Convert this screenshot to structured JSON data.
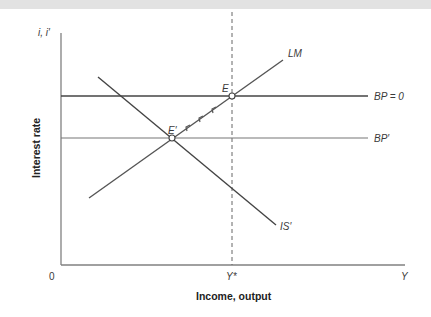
{
  "diagram": {
    "type": "IS-LM-BP model",
    "y_axis": {
      "symbol": "i, i′",
      "title": "Interest rate"
    },
    "x_axis": {
      "title": "Income, output",
      "origin_label": "0",
      "tick_ystar": "Y*",
      "end_label": "Y"
    },
    "curves": {
      "lm": "LM",
      "is": "IS′",
      "bp0": "BP = 0",
      "bp_prime": "BP′"
    },
    "points": {
      "e": "E",
      "e_prime": "E′"
    },
    "colors": {
      "line": "#555555",
      "axis": "#777777",
      "band": "#e2e2e2"
    }
  }
}
